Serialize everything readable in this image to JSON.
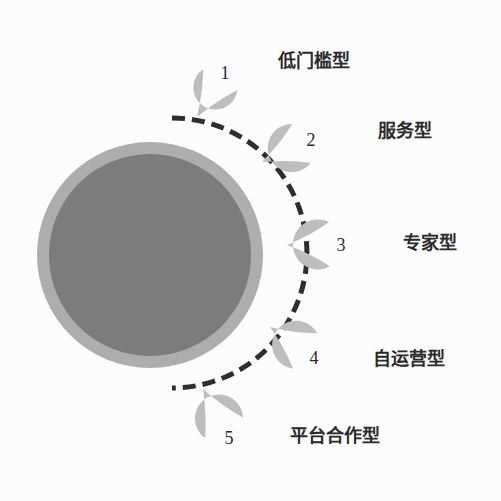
{
  "diagram": {
    "colors": {
      "background": "#fcfcfc",
      "core_fill": "#7c7c7c",
      "core_ring": "#adadad",
      "dashed_arc": "#2e2e2e",
      "droplet_fill": "#bdbdbd",
      "label_text": "#2a2a2a",
      "number_text": "#2b2b2b"
    },
    "core_circle": {
      "cx": 150,
      "cy": 255,
      "outer_radius": 113,
      "inner_radius": 101
    },
    "dashed_arc": {
      "cx": 150,
      "cy": 255,
      "radius": 133,
      "start_point": [
        172,
        118
      ],
      "end_point": [
        172,
        388
      ]
    },
    "items": [
      {
        "number": "1",
        "label": "低门槛型",
        "blob": {
          "cx": 225,
          "cy": 72,
          "r": 22
        },
        "tip": [
          197,
          117
        ],
        "label_pos": [
          278,
          51
        ]
      },
      {
        "number": "2",
        "label": "服务型",
        "blob": {
          "cx": 311,
          "cy": 139,
          "r": 24
        },
        "tip": [
          262,
          162
        ],
        "label_pos": [
          378,
          121
        ]
      },
      {
        "number": "3",
        "label": "专家型",
        "blob": {
          "cx": 341,
          "cy": 244,
          "r": 25
        },
        "tip": [
          287,
          245
        ],
        "label_pos": [
          403,
          233
        ]
      },
      {
        "number": "4",
        "label": "自运营型",
        "blob": {
          "cx": 314,
          "cy": 357,
          "r": 24
        },
        "tip": [
          270,
          327
        ],
        "label_pos": [
          373,
          349
        ]
      },
      {
        "number": "5",
        "label": "平台合作型",
        "blob": {
          "cx": 229,
          "cy": 437,
          "r": 24
        },
        "tip": [
          203,
          389
        ],
        "label_pos": [
          290,
          426
        ]
      }
    ]
  }
}
